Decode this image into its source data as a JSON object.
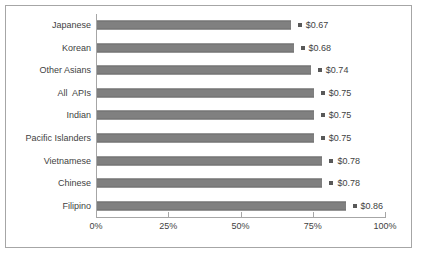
{
  "chart_data": {
    "type": "bar",
    "orientation": "horizontal",
    "title": "",
    "xlabel": "",
    "ylabel": "",
    "xlim": [
      0,
      1.0
    ],
    "grid": false,
    "legend": false,
    "categories": [
      "Japanese",
      "Korean",
      "Other Asians",
      "All  APIs",
      "Indian",
      "Pacific Islanders",
      "Vietnamese",
      "Chinese",
      "Filipino"
    ],
    "values": [
      0.67,
      0.68,
      0.74,
      0.75,
      0.75,
      0.75,
      0.78,
      0.78,
      0.86
    ],
    "data_labels": [
      "$0.67",
      "$0.68",
      "$0.74",
      "$0.75",
      "$0.75",
      "$0.75",
      "$0.78",
      "$0.78",
      "$0.86"
    ],
    "tick_values": [
      0,
      0.25,
      0.5,
      0.75,
      1.0
    ],
    "tick_labels": [
      "0%",
      "25%",
      "50%",
      "75%",
      "100%"
    ],
    "colors": {
      "bar": "#808080",
      "bar_edge": "#6e6e6e",
      "marker": "#595959",
      "axis": "#a6a6a6",
      "frame": "#a6a6a6",
      "text": "#3f3f3f",
      "background": "#ffffff"
    }
  }
}
